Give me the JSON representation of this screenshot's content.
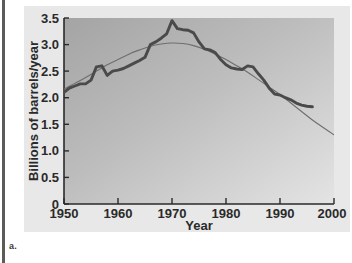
{
  "caption": {
    "label": "a."
  },
  "colors": {
    "data_curve": "#4a4a4a",
    "trend_curve": "#6e6e6e",
    "axis": "#2a2a2a",
    "plot_bg_dark": "#a9a9a9",
    "plot_bg_light": "#e2e2e2",
    "panel_bg": "#e8e8e8",
    "page_edge": "#5b5b5b"
  },
  "chart_data": {
    "type": "line",
    "title": "",
    "xlabel": "Year",
    "ylabel": "Billions of barrels/year",
    "xlim": [
      1950,
      2000
    ],
    "ylim": [
      0,
      3.5
    ],
    "xticks": [
      1950,
      1960,
      1970,
      1980,
      1990,
      2000
    ],
    "xtick_labels": [
      "1950",
      "1960",
      "1970",
      "1980",
      "1990",
      "2000"
    ],
    "yticks": [
      0,
      0.5,
      1.0,
      1.5,
      2.0,
      2.5,
      3.0,
      3.5
    ],
    "ytick_labels": [
      "0",
      "0.5",
      "1.0",
      "1.5",
      "2.0",
      "2.5",
      "3.0",
      "3.5"
    ],
    "grid": false,
    "legend_position": "none",
    "series": [
      {
        "name": "Observed discoveries",
        "style": "thick-line",
        "color": "#4a4a4a",
        "x": [
          1950,
          1951,
          1952,
          1953,
          1954,
          1955,
          1956,
          1957,
          1958,
          1959,
          1960,
          1961,
          1962,
          1963,
          1964,
          1965,
          1966,
          1967,
          1968,
          1969,
          1970,
          1971,
          1972,
          1973,
          1974,
          1975,
          1976,
          1977,
          1978,
          1979,
          1980,
          1981,
          1982,
          1983,
          1984,
          1985,
          1986,
          1987,
          1988,
          1989,
          1990,
          1991,
          1992,
          1993,
          1994,
          1995,
          1996
        ],
        "y": [
          2.1,
          2.18,
          2.22,
          2.26,
          2.26,
          2.33,
          2.58,
          2.6,
          2.42,
          2.5,
          2.52,
          2.55,
          2.6,
          2.65,
          2.7,
          2.76,
          3.0,
          3.05,
          3.12,
          3.2,
          3.45,
          3.3,
          3.28,
          3.27,
          3.22,
          3.05,
          2.92,
          2.9,
          2.85,
          2.72,
          2.62,
          2.56,
          2.54,
          2.53,
          2.6,
          2.58,
          2.45,
          2.33,
          2.18,
          2.07,
          2.05,
          2.0,
          1.96,
          1.9,
          1.86,
          1.84,
          1.83
        ]
      },
      {
        "name": "Fitted trend",
        "style": "thin-line",
        "color": "#6e6e6e",
        "x": [
          1950,
          1952,
          1954,
          1956,
          1958,
          1960,
          1962,
          1964,
          1966,
          1968,
          1970,
          1972,
          1974,
          1976,
          1978,
          1980,
          1982,
          1984,
          1986,
          1988,
          1990,
          1992,
          1994,
          1996,
          1998,
          2000
        ],
        "y": [
          2.16,
          2.27,
          2.38,
          2.5,
          2.62,
          2.72,
          2.82,
          2.9,
          2.97,
          3.01,
          3.03,
          3.02,
          2.98,
          2.91,
          2.82,
          2.72,
          2.6,
          2.48,
          2.34,
          2.2,
          2.06,
          1.9,
          1.74,
          1.58,
          1.44,
          1.3
        ]
      }
    ]
  }
}
